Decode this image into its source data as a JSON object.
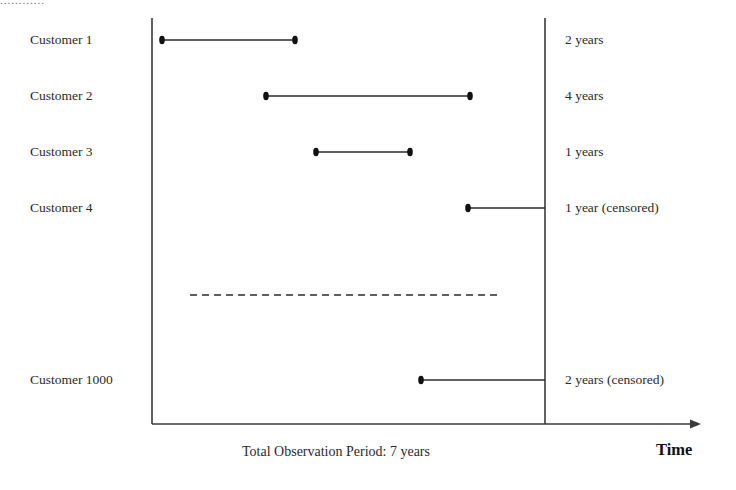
{
  "figure": {
    "axis_caption": "Total Observation Period: 7 years",
    "time_axis_label": "Time",
    "ellipsis": "............",
    "ink_color": "#2b2b2b",
    "background_color": "#ffffff"
  },
  "chart_data": {
    "type": "line",
    "title": "",
    "xlabel": "Time",
    "ylabel": "",
    "annotations": [
      "Total Observation Period: 7 years",
      "Time"
    ],
    "axis_ranges": {
      "observation_start_year": 0,
      "observation_end_year": 7
    },
    "grid": false,
    "legend": "none",
    "categories": [
      "Customer 1",
      "Customer 2",
      "Customer 3",
      "Customer 4",
      "............",
      "Customer 1000"
    ],
    "rows": [
      {
        "label": "Customer 1",
        "duration_label": "2 years",
        "duration_years": 2,
        "censored": false,
        "start_px": 162,
        "end_px": 295,
        "y_px": 40,
        "start_marker": true,
        "end_marker": true,
        "style": "solid"
      },
      {
        "label": "Customer 2",
        "duration_label": "4 years",
        "duration_years": 4,
        "censored": false,
        "start_px": 266,
        "end_px": 470,
        "y_px": 96,
        "start_marker": true,
        "end_marker": true,
        "style": "solid"
      },
      {
        "label": "Customer 3",
        "duration_label": "1 years",
        "duration_years": 1,
        "censored": false,
        "start_px": 316,
        "end_px": 410,
        "y_px": 152,
        "start_marker": true,
        "end_marker": true,
        "style": "solid"
      },
      {
        "label": "Customer 4",
        "duration_label": "1 year (censored)",
        "duration_years": 1,
        "censored": true,
        "start_px": 468,
        "end_px": 545,
        "y_px": 208,
        "start_marker": true,
        "end_marker": false,
        "style": "solid"
      },
      {
        "label": "............",
        "duration_label": "",
        "duration_years": null,
        "censored": false,
        "start_px": 190,
        "end_px": 502,
        "y_px": 295,
        "start_marker": false,
        "end_marker": false,
        "style": "dashed"
      },
      {
        "label": "Customer 1000",
        "duration_label": "2 years (censored)",
        "duration_years": 2,
        "censored": true,
        "start_px": 421,
        "end_px": 545,
        "y_px": 380,
        "start_marker": true,
        "end_marker": false,
        "style": "solid"
      }
    ],
    "axes": {
      "left_vertical_x_px": 152,
      "right_vertical_x_px": 545,
      "baseline_y_px": 424,
      "top_y_px": 18,
      "arrow_end_x_px": 692
    }
  }
}
